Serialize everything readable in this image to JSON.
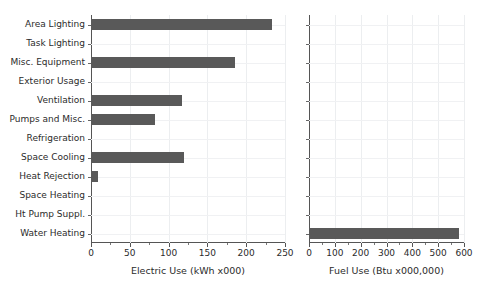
{
  "chart_data": [
    {
      "type": "bar",
      "orientation": "horizontal",
      "panel": "left",
      "title": "",
      "xlabel": "Electric Use (kWh x000)",
      "ylabel": "",
      "xlim": [
        0,
        250
      ],
      "xticks": [
        0,
        50,
        100,
        150,
        200,
        250
      ],
      "xticklabels": [
        "0",
        "50",
        "100",
        "150",
        "200",
        "250"
      ],
      "minor_tick_step": 25,
      "grid": true,
      "legend": "none",
      "bar_color": "#595959",
      "categories": [
        "Area Lighting",
        "Task Lighting",
        "Misc. Equipment",
        "Exterior Usage",
        "Ventilation",
        "Pumps and Misc.",
        "Refrigeration",
        "Space Cooling",
        "Heat Rejection",
        "Space Heating",
        "Ht Pump Suppl.",
        "Water Heating"
      ],
      "values": [
        233,
        0,
        186,
        0,
        117,
        82,
        0,
        120,
        9,
        0,
        0,
        0
      ]
    },
    {
      "type": "bar",
      "orientation": "horizontal",
      "panel": "right",
      "title": "",
      "xlabel": "Fuel Use (Btu x000,000)",
      "ylabel": "",
      "xlim": [
        0,
        600
      ],
      "xticks": [
        0,
        100,
        200,
        300,
        400,
        500,
        600
      ],
      "xticklabels": [
        "0",
        "100",
        "200",
        "300",
        "400",
        "500",
        "600"
      ],
      "minor_tick_step": 50,
      "grid": true,
      "legend": "none",
      "bar_color": "#595959",
      "categories": [
        "Area Lighting",
        "Task Lighting",
        "Misc. Equipment",
        "Exterior Usage",
        "Ventilation",
        "Pumps and Misc.",
        "Refrigeration",
        "Space Cooling",
        "Heat Rejection",
        "Space Heating",
        "Ht Pump Suppl.",
        "Water Heating"
      ],
      "values": [
        0,
        0,
        0,
        0,
        0,
        0,
        0,
        0,
        0,
        0,
        0,
        580
      ]
    }
  ]
}
